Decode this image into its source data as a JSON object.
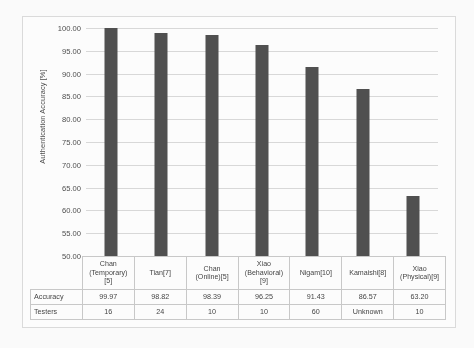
{
  "chart_data": {
    "type": "bar",
    "title": "",
    "xlabel": "",
    "ylabel": "Authentication Accuracy [%]",
    "ylim": [
      50.0,
      100.0
    ],
    "ytick_step": 5.0,
    "ytick_labels": [
      "100.00",
      "95.00",
      "90.00",
      "85.00",
      "80.00",
      "75.00",
      "70.00",
      "65.00",
      "60.00",
      "55.00",
      "50.00"
    ],
    "grid": true,
    "legend": false,
    "bar_color": "#4d4d4d",
    "categories": [
      "Chan (Temporary)[5]",
      "Tian[7]",
      "Chan (Online)[5]",
      "Xiao (Behavioral)[9]",
      "Nigam[10]",
      "Kamaishi[8]",
      "Xiao (Physical)[9]"
    ],
    "values": [
      99.97,
      98.82,
      98.39,
      96.25,
      91.43,
      86.57,
      63.2
    ],
    "series": [
      {
        "name": "Accuracy",
        "values": [
          99.97,
          98.82,
          98.39,
          96.25,
          91.43,
          86.57,
          63.2
        ]
      }
    ]
  },
  "axis": {
    "y_title": "Authentication Accuracy [%]"
  },
  "table": {
    "row_labels": [
      "Accuracy",
      "Testers"
    ],
    "categories": [
      {
        "line1": "Chan",
        "line2": "(Temporary)",
        "line3": "[5]"
      },
      {
        "line1": "Tian[7]",
        "line2": "",
        "line3": ""
      },
      {
        "line1": "Chan",
        "line2": "(Online)[5]",
        "line3": ""
      },
      {
        "line1": "Xiao",
        "line2": "(Behavioral)",
        "line3": "[9]"
      },
      {
        "line1": "Nigam[10]",
        "line2": "",
        "line3": ""
      },
      {
        "line1": "Kamaishi[8]",
        "line2": "",
        "line3": ""
      },
      {
        "line1": "Xiao",
        "line2": "(Physical)[9]",
        "line3": ""
      }
    ],
    "accuracy": [
      "99.97",
      "98.82",
      "98.39",
      "96.25",
      "91.43",
      "86.57",
      "63.20"
    ],
    "testers": [
      "16",
      "24",
      "10",
      "10",
      "60",
      "Unknown",
      "10"
    ]
  }
}
